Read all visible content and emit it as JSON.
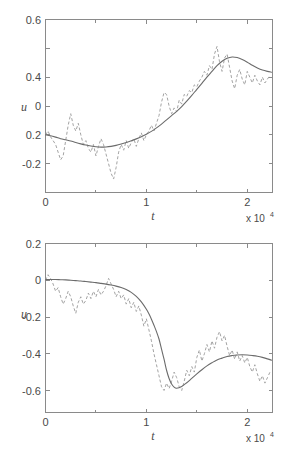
{
  "figure": {
    "background": "#ffffff",
    "line_colors": {
      "smooth": "#6b6b6b",
      "noisy": "#a3a3a3",
      "axis": "#8a8a8a"
    }
  },
  "chart_data": [
    {
      "type": "line",
      "panel": "top",
      "title": "",
      "xlabel": "t",
      "ylabel": "u",
      "x_exponent_label": "x 10",
      "x_exponent_power": "4",
      "x_scale": 10000,
      "xlim": [
        0,
        22500
      ],
      "ylim": [
        -0.3,
        0.6
      ],
      "grid": false,
      "legend": null,
      "xticks": [
        0,
        10000,
        20000
      ],
      "xticklabels": [
        "0",
        "1",
        "2"
      ],
      "xminorticks": [
        5000,
        15000
      ],
      "yticks": [
        -0.2,
        0,
        0.2,
        0.4,
        0.6
      ],
      "yticklabels": [
        "-0.2",
        "0",
        "0.2",
        "0.4",
        "0.6"
      ],
      "series": [
        {
          "name": "noisy",
          "style": "dashed",
          "color": "#a3a3a3",
          "x": [
            0,
            250,
            500,
            750,
            1000,
            1250,
            1500,
            1750,
            2000,
            2250,
            2500,
            2750,
            3000,
            3250,
            3500,
            3750,
            4000,
            4250,
            4500,
            4750,
            5000,
            5250,
            5500,
            5750,
            6000,
            6250,
            6500,
            6750,
            7000,
            7250,
            7500,
            7750,
            8000,
            8250,
            8500,
            8750,
            9000,
            9250,
            9500,
            9750,
            10000,
            10250,
            10500,
            10750,
            11000,
            11250,
            11500,
            11750,
            12000,
            12250,
            12500,
            12750,
            13000,
            13250,
            13500,
            13750,
            14000,
            14250,
            14500,
            14750,
            15000,
            15250,
            15500,
            15750,
            16000,
            16250,
            16500,
            16750,
            17000,
            17250,
            17500,
            17750,
            18000,
            18250,
            18500,
            18750,
            19000,
            19250,
            19500,
            19750,
            20000,
            20250,
            20500,
            20750,
            21000,
            21250,
            21500,
            21750,
            22000,
            22250
          ],
          "y": [
            0.0,
            0.02,
            -0.01,
            -0.03,
            -0.05,
            -0.09,
            -0.13,
            -0.11,
            -0.03,
            0.05,
            0.11,
            0.05,
            0.02,
            0.06,
            0.0,
            -0.05,
            -0.03,
            -0.07,
            -0.09,
            -0.05,
            -0.11,
            -0.06,
            -0.02,
            -0.05,
            -0.1,
            -0.15,
            -0.2,
            -0.23,
            -0.17,
            -0.09,
            -0.05,
            -0.08,
            -0.03,
            -0.07,
            -0.04,
            -0.02,
            -0.06,
            -0.02,
            0.01,
            -0.03,
            0.0,
            0.02,
            0.05,
            0.02,
            0.06,
            0.1,
            0.17,
            0.22,
            0.21,
            0.15,
            0.11,
            0.14,
            0.12,
            0.18,
            0.16,
            0.21,
            0.2,
            0.23,
            0.22,
            0.26,
            0.25,
            0.28,
            0.3,
            0.33,
            0.31,
            0.36,
            0.34,
            0.42,
            0.46,
            0.38,
            0.33,
            0.4,
            0.42,
            0.35,
            0.28,
            0.24,
            0.31,
            0.34,
            0.29,
            0.26,
            0.33,
            0.3,
            0.27,
            0.31,
            0.28,
            0.26,
            0.3,
            0.27,
            0.29,
            0.31
          ]
        },
        {
          "name": "smooth",
          "style": "solid",
          "color": "#6b6b6b",
          "x": [
            0,
            500,
            1000,
            1500,
            2000,
            2500,
            3000,
            3500,
            4000,
            4500,
            5000,
            5500,
            6000,
            6500,
            7000,
            7500,
            8000,
            8500,
            9000,
            9500,
            10000,
            10500,
            11000,
            11500,
            12000,
            12500,
            13000,
            13500,
            14000,
            14500,
            15000,
            15500,
            16000,
            16500,
            17000,
            17500,
            18000,
            18500,
            19000,
            19500,
            20000,
            20500,
            21000,
            21500,
            22000,
            22400
          ],
          "y": [
            0.0,
            -0.005,
            -0.012,
            -0.02,
            -0.026,
            -0.032,
            -0.04,
            -0.047,
            -0.053,
            -0.058,
            -0.062,
            -0.064,
            -0.063,
            -0.06,
            -0.055,
            -0.048,
            -0.04,
            -0.031,
            -0.021,
            -0.01,
            0.003,
            0.018,
            0.036,
            0.056,
            0.078,
            0.1,
            0.122,
            0.147,
            0.175,
            0.205,
            0.237,
            0.268,
            0.3,
            0.33,
            0.36,
            0.383,
            0.398,
            0.405,
            0.402,
            0.392,
            0.378,
            0.362,
            0.348,
            0.337,
            0.33,
            0.326
          ]
        }
      ]
    },
    {
      "type": "line",
      "panel": "bottom",
      "title": "",
      "xlabel": "t",
      "ylabel": "u",
      "x_exponent_label": "x 10",
      "x_exponent_power": "4",
      "x_scale": 10000,
      "xlim": [
        0,
        22500
      ],
      "ylim": [
        -0.72,
        0.2
      ],
      "grid": false,
      "legend": null,
      "xticks": [
        0,
        10000,
        20000
      ],
      "xticklabels": [
        "0",
        "1",
        "2"
      ],
      "xminorticks": [
        5000,
        15000
      ],
      "yticks": [
        -0.6,
        -0.4,
        -0.2,
        0,
        0.2
      ],
      "yticklabels": [
        "-0.6",
        "-0.4",
        "-0.2",
        "0",
        "0.2"
      ],
      "series": [
        {
          "name": "noisy",
          "style": "dashed",
          "color": "#a3a3a3",
          "x": [
            0,
            250,
            500,
            750,
            1000,
            1250,
            1500,
            1750,
            2000,
            2250,
            2500,
            2750,
            3000,
            3250,
            3500,
            3750,
            4000,
            4250,
            4500,
            4750,
            5000,
            5250,
            5500,
            5750,
            6000,
            6250,
            6500,
            6750,
            7000,
            7250,
            7500,
            7750,
            8000,
            8250,
            8500,
            8750,
            9000,
            9250,
            9500,
            9750,
            10000,
            10250,
            10500,
            10750,
            11000,
            11250,
            11500,
            11750,
            12000,
            12250,
            12500,
            12750,
            13000,
            13250,
            13500,
            13750,
            14000,
            14250,
            14500,
            14750,
            15000,
            15250,
            15500,
            15750,
            16000,
            16250,
            16500,
            16750,
            17000,
            17250,
            17500,
            17750,
            18000,
            18250,
            18500,
            18750,
            19000,
            19250,
            19500,
            19750,
            20000,
            20250,
            20500,
            20750,
            21000,
            21250,
            21500,
            21750,
            22000,
            22250
          ],
          "y": [
            0.0,
            0.03,
            0.01,
            -0.02,
            -0.06,
            -0.04,
            -0.09,
            -0.13,
            -0.1,
            -0.06,
            -0.09,
            -0.14,
            -0.18,
            -0.12,
            -0.09,
            -0.13,
            -0.11,
            -0.07,
            -0.1,
            -0.06,
            -0.09,
            -0.05,
            -0.08,
            -0.06,
            -0.03,
            0.01,
            -0.02,
            -0.05,
            -0.09,
            -0.06,
            -0.1,
            -0.08,
            -0.13,
            -0.1,
            -0.15,
            -0.12,
            -0.17,
            -0.14,
            -0.19,
            -0.25,
            -0.21,
            -0.27,
            -0.33,
            -0.4,
            -0.46,
            -0.52,
            -0.58,
            -0.6,
            -0.56,
            -0.59,
            -0.55,
            -0.5,
            -0.53,
            -0.58,
            -0.6,
            -0.55,
            -0.49,
            -0.52,
            -0.47,
            -0.5,
            -0.42,
            -0.38,
            -0.44,
            -0.4,
            -0.35,
            -0.39,
            -0.33,
            -0.37,
            -0.31,
            -0.28,
            -0.33,
            -0.3,
            -0.36,
            -0.41,
            -0.38,
            -0.43,
            -0.39,
            -0.44,
            -0.41,
            -0.45,
            -0.42,
            -0.47,
            -0.5,
            -0.46,
            -0.51,
            -0.55,
            -0.52,
            -0.56,
            -0.53,
            -0.5
          ]
        },
        {
          "name": "smooth",
          "style": "solid",
          "color": "#6b6b6b",
          "x": [
            0,
            500,
            1000,
            1500,
            2000,
            2500,
            3000,
            3500,
            4000,
            4500,
            5000,
            5500,
            6000,
            6500,
            7000,
            7500,
            8000,
            8500,
            9000,
            9500,
            10000,
            10250,
            10500,
            10750,
            11000,
            11250,
            11500,
            11750,
            12000,
            12250,
            12500,
            12750,
            13000,
            13500,
            14000,
            14500,
            15000,
            15500,
            16000,
            16500,
            17000,
            17500,
            18000,
            18500,
            19000,
            19500,
            20000,
            20500,
            21000,
            21500,
            22000,
            22400
          ],
          "y": [
            0.003,
            0.004,
            0.004,
            0.003,
            0.002,
            0.0,
            -0.002,
            -0.004,
            -0.007,
            -0.01,
            -0.013,
            -0.017,
            -0.021,
            -0.026,
            -0.032,
            -0.04,
            -0.051,
            -0.066,
            -0.088,
            -0.118,
            -0.158,
            -0.183,
            -0.212,
            -0.245,
            -0.28,
            -0.32,
            -0.375,
            -0.43,
            -0.49,
            -0.535,
            -0.565,
            -0.582,
            -0.588,
            -0.578,
            -0.558,
            -0.534,
            -0.51,
            -0.487,
            -0.466,
            -0.449,
            -0.434,
            -0.424,
            -0.415,
            -0.41,
            -0.407,
            -0.406,
            -0.407,
            -0.41,
            -0.414,
            -0.42,
            -0.428,
            -0.435
          ]
        }
      ]
    }
  ]
}
